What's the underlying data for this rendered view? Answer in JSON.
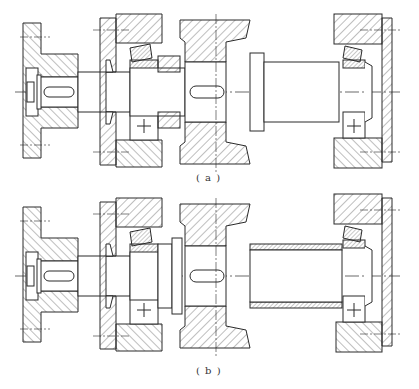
{
  "figure": {
    "type": "mechanical shaft assembly cross-section",
    "line_color": "#2a2a2a",
    "background": "#ffffff",
    "panels": [
      {
        "id": "a",
        "caption": "( a )",
        "components": [
          "coupling flange",
          "end cover with seal",
          "tapered roller bearing (left)",
          "shaft shoulder",
          "gear with keyway",
          "shaft",
          "tapered roller bearing (right)",
          "end cap"
        ]
      },
      {
        "id": "b",
        "caption": "( b )",
        "components": [
          "coupling flange",
          "end cover with seal",
          "tapered roller bearing (left)",
          "spacer ring",
          "gear with keyway",
          "sleeve (spacer tube)",
          "tapered roller bearing (right)",
          "end cap"
        ]
      }
    ]
  }
}
